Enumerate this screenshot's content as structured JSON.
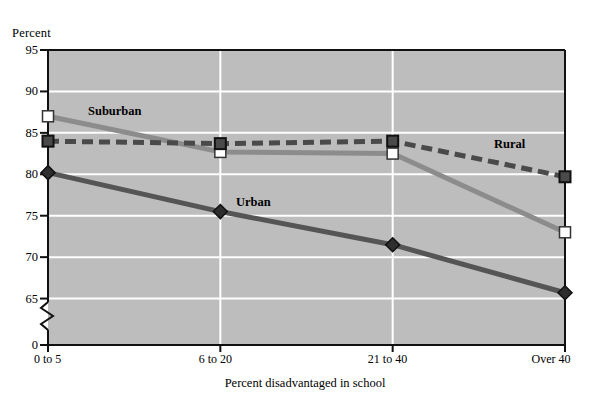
{
  "chart_data": {
    "type": "line",
    "title": "",
    "xlabel": "Percent disadvantaged in school",
    "ylabel": "Percent",
    "categories": [
      "0 to 5",
      "6 to 20",
      "21 to 40",
      "Over 40"
    ],
    "ylim": [
      63.5,
      95
    ],
    "yticks": [
      95,
      90,
      85,
      80,
      75,
      70,
      65,
      0
    ],
    "ytick_labels": [
      "95",
      "90",
      "85",
      "80",
      "75",
      "70",
      "65",
      "0"
    ],
    "axis_break": true,
    "grid": "horizontal-and-vertical",
    "legend": "inline-labels",
    "series": [
      {
        "name": "Suburban",
        "values": [
          87.0,
          82.7,
          82.5,
          73.0
        ],
        "color": "#8c8c8c",
        "marker": "white-square",
        "dash": "solid"
      },
      {
        "name": "Rural",
        "values": [
          84.0,
          83.7,
          84.0,
          79.7
        ],
        "color": "#4a4a4a",
        "marker": "dark-square",
        "dash": "dashed"
      },
      {
        "name": "Urban",
        "values": [
          80.2,
          75.5,
          71.5,
          65.7
        ],
        "color": "#555555",
        "marker": "dark-diamond",
        "dash": "solid"
      }
    ],
    "plot_background": "#bdbdbd",
    "gridline_color": "#ffffff"
  },
  "labels": {
    "suburban": "Suburban",
    "rural": "Rural",
    "urban": "Urban"
  },
  "annotations": {
    "suburban": {
      "x": 88,
      "y": 104
    },
    "rural": {
      "x": 494,
      "y": 137
    },
    "urban": {
      "x": 236,
      "y": 195
    }
  }
}
